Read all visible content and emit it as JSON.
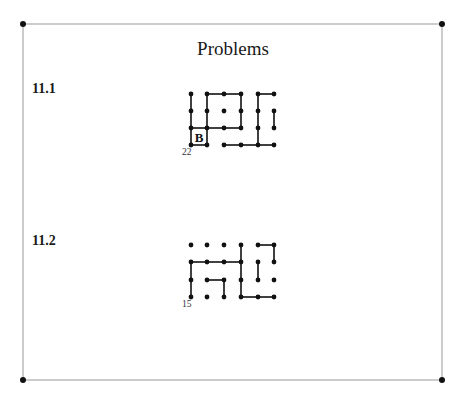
{
  "page": {
    "title": "Problems",
    "frame": {
      "x1": 23,
      "y1": 24,
      "x2": 442,
      "y2": 380
    },
    "colors": {
      "frame": "#999999",
      "ink": "#111111"
    }
  },
  "grid": {
    "columns_x": [
      191,
      207,
      224,
      241,
      258,
      274
    ]
  },
  "problems": [
    {
      "label": "11.1",
      "label_y": 90,
      "count": "22",
      "count_x": 182,
      "count_y": 153,
      "rows_y": [
        94,
        111,
        128,
        145
      ],
      "box": {
        "label": "B",
        "col": 0,
        "row": 2
      },
      "h_edges": [
        [
          0,
          1,
          2
        ],
        [
          0,
          2,
          3
        ],
        [
          0,
          4,
          5
        ],
        [
          2,
          0,
          1
        ],
        [
          2,
          1,
          2
        ],
        [
          2,
          2,
          3
        ],
        [
          3,
          0,
          1
        ],
        [
          3,
          2,
          3
        ],
        [
          3,
          3,
          4
        ],
        [
          3,
          4,
          5
        ]
      ],
      "v_edges": [
        [
          0,
          0,
          1
        ],
        [
          0,
          1,
          2
        ],
        [
          0,
          2,
          3
        ],
        [
          1,
          0,
          1
        ],
        [
          1,
          1,
          2
        ],
        [
          1,
          2,
          3
        ],
        [
          3,
          0,
          1
        ],
        [
          3,
          1,
          2
        ],
        [
          4,
          0,
          1
        ],
        [
          4,
          1,
          2
        ],
        [
          4,
          2,
          3
        ],
        [
          5,
          1,
          2
        ]
      ]
    },
    {
      "label": "11.2",
      "label_y": 242,
      "count": "15",
      "count_x": 182,
      "count_y": 305,
      "rows_y": [
        245,
        262,
        280,
        297
      ],
      "box": null,
      "h_edges": [
        [
          0,
          4,
          5
        ],
        [
          1,
          0,
          1
        ],
        [
          1,
          1,
          2
        ],
        [
          1,
          2,
          3
        ],
        [
          2,
          1,
          2
        ],
        [
          3,
          3,
          4
        ],
        [
          3,
          4,
          5
        ]
      ],
      "v_edges": [
        [
          0,
          1,
          2
        ],
        [
          0,
          2,
          3
        ],
        [
          2,
          2,
          3
        ],
        [
          3,
          0,
          1
        ],
        [
          3,
          1,
          2
        ],
        [
          3,
          2,
          3
        ],
        [
          4,
          1,
          2
        ],
        [
          5,
          0,
          1
        ]
      ]
    }
  ]
}
